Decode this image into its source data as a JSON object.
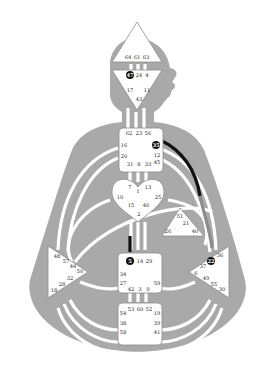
{
  "colors": {
    "body": "#a9a9a9",
    "center_fill": "#ffffff",
    "center_stroke": "#8a8a8a",
    "channel_open": "#ffffff",
    "channel_defined": "#111111",
    "channel_partial": "#8c8c8c",
    "active_gate": "#111111"
  },
  "centers": {
    "head": {
      "gates": [
        "64",
        "61",
        "63"
      ]
    },
    "ajna": {
      "gates": [
        "47",
        "24",
        "4",
        "17",
        "11",
        "43"
      ],
      "active": [
        "47"
      ]
    },
    "throat": {
      "gates": [
        "62",
        "23",
        "56",
        "16",
        "35",
        "20",
        "12",
        "31",
        "8",
        "33",
        "45"
      ],
      "active": [
        "35"
      ]
    },
    "g": {
      "gates": [
        "7",
        "1",
        "13",
        "10",
        "25",
        "15",
        "46",
        "2"
      ]
    },
    "heart": {
      "gates": [
        "51",
        "21",
        "26",
        "40"
      ]
    },
    "spleen": {
      "gates": [
        "48",
        "57",
        "44",
        "50",
        "32",
        "28",
        "18"
      ]
    },
    "solar_plexus": {
      "gates": [
        "36",
        "22",
        "37",
        "6",
        "49",
        "55",
        "30"
      ],
      "active": [
        "22"
      ]
    },
    "sacral": {
      "gates": [
        "5",
        "14",
        "29",
        "34",
        "27",
        "59",
        "42",
        "3",
        "9"
      ],
      "active": [
        "5"
      ]
    },
    "root": {
      "gates": [
        "53",
        "60",
        "52",
        "54",
        "19",
        "38",
        "39",
        "58",
        "41"
      ]
    }
  },
  "defined_channels": [
    "35-36 (throat to solar plexus)",
    "5 hanging gate (sacral to G)"
  ]
}
